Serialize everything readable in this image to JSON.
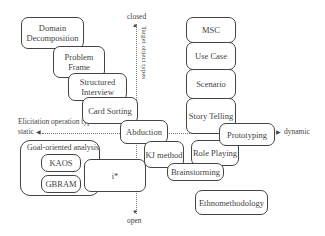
{
  "diagram": {
    "vertical_axis": {
      "title": "Target object types",
      "top_label": "closed",
      "bottom_label": "open"
    },
    "horizontal_axis": {
      "title": "Elicitation operation types",
      "left_label": "static",
      "right_label": "dynamic"
    },
    "left_stack": [
      "Domain Decomposition",
      "Problem Frame",
      "Structured Interview",
      "Card Sorting"
    ],
    "right_stack": [
      "MSC",
      "Use Case",
      "Scenario",
      "Story Telling"
    ],
    "goal_group": {
      "title": "Goal-oriented analysis",
      "items": [
        "KAOS",
        "GBRAM"
      ]
    },
    "center": {
      "abduction": "Abduction",
      "istar": "i*",
      "kj_method": "KJ method",
      "brainstorming": "Brainstorming",
      "role_playing": "Role Playing",
      "prototyping": "Prototyping",
      "ethnomethodology": "Ethnomethodology"
    }
  }
}
